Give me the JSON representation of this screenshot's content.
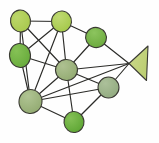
{
  "figure": {
    "type": "node-link-diagram",
    "background_color": "#fefefe",
    "width": 159,
    "height": 143
  },
  "style": {
    "edge_color": "#2b2b28",
    "node_outline_color": "#3a3a33",
    "edge_width": 1.15,
    "node_outline_width": 1.1
  },
  "chart_data": {
    "type": "diagram",
    "xlabel": "",
    "ylabel": "",
    "nodes": [
      {
        "id": "n1",
        "label": "",
        "x": 20.5,
        "y": 21.0,
        "rx": 10.0,
        "ry": 11.0,
        "rotation": -8,
        "fill": "#a9c94e",
        "highlight": "#bcd76a"
      },
      {
        "id": "n2",
        "label": "",
        "x": 61.5,
        "y": 21.5,
        "rx": 10.0,
        "ry": 10.5,
        "rotation": 6,
        "fill": "#a5c94a",
        "highlight": "#bfd972"
      },
      {
        "id": "n3",
        "label": "",
        "x": 20.0,
        "y": 55.5,
        "rx": 10.5,
        "ry": 12.0,
        "rotation": -5,
        "fill": "#68ab3c",
        "highlight": "#85c155"
      },
      {
        "id": "n4",
        "label": "",
        "x": 96.0,
        "y": 37.5,
        "rx": 10.5,
        "ry": 10.0,
        "rotation": 18,
        "fill": "#6cab3e",
        "highlight": "#8cc45e"
      },
      {
        "id": "n5",
        "label": "",
        "x": 66.5,
        "y": 70.0,
        "rx": 11.0,
        "ry": 10.5,
        "rotation": -4,
        "fill": "#93ab72",
        "highlight": "#aec191"
      },
      {
        "id": "n6",
        "label": "",
        "x": 30.5,
        "y": 101.5,
        "rx": 11.5,
        "ry": 12.0,
        "rotation": 10,
        "fill": "#93ab72",
        "highlight": "#b0c493"
      },
      {
        "id": "n7",
        "label": "",
        "x": 108.5,
        "y": 87.5,
        "rx": 10.5,
        "ry": 10.5,
        "rotation": 0,
        "fill": "#92ab80",
        "highlight": "#acc09a"
      },
      {
        "id": "n8",
        "label": "",
        "x": 74.0,
        "y": 122.0,
        "rx": 10.0,
        "ry": 10.5,
        "rotation": -6,
        "fill": "#5ea634",
        "highlight": "#84c056"
      }
    ],
    "cone": {
      "id": "c1",
      "label": "",
      "apex_x": 129.0,
      "apex_y": 63.5,
      "base_top_x": 148.0,
      "base_top_y": 46.0,
      "base_bottom_x": 146.5,
      "base_bottom_y": 80.5,
      "fill": "#bcce72",
      "highlight": "#ccd98c"
    },
    "edges": [
      {
        "from": "n1",
        "to": "n2"
      },
      {
        "from": "n1",
        "to": "n3"
      },
      {
        "from": "n1",
        "to": "n5"
      },
      {
        "from": "n1",
        "to": "n6"
      },
      {
        "from": "n2",
        "to": "n3"
      },
      {
        "from": "n2",
        "to": "n4"
      },
      {
        "from": "n2",
        "to": "n5"
      },
      {
        "from": "n2",
        "to": "n6"
      },
      {
        "from": "n3",
        "to": "n5"
      },
      {
        "from": "n3",
        "to": "n6"
      },
      {
        "from": "n4",
        "to": "n5"
      },
      {
        "from": "n4",
        "to": "c1"
      },
      {
        "from": "n5",
        "to": "n6"
      },
      {
        "from": "n5",
        "to": "n7"
      },
      {
        "from": "n5",
        "to": "n8"
      },
      {
        "from": "n5",
        "to": "c1"
      },
      {
        "from": "n6",
        "to": "n7"
      },
      {
        "from": "n6",
        "to": "n8"
      },
      {
        "from": "n6",
        "to": "c1"
      },
      {
        "from": "n7",
        "to": "n8"
      },
      {
        "from": "n7",
        "to": "c1"
      }
    ],
    "node_count": 8,
    "cone_count": 1,
    "edge_count": 21,
    "legend": [],
    "grid": false
  }
}
